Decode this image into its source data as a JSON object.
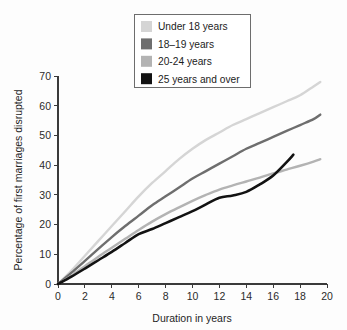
{
  "chart_data": {
    "type": "line",
    "title": "",
    "xlabel": "Duration in years",
    "ylabel": "Percentage of first marriages disrupted",
    "xlim": [
      0,
      20
    ],
    "ylim": [
      0,
      70
    ],
    "xticks": [
      0,
      2,
      4,
      6,
      8,
      10,
      12,
      14,
      16,
      18,
      20
    ],
    "yticks": [
      0,
      10,
      20,
      30,
      40,
      50,
      60,
      70
    ],
    "grid": false,
    "legend_position": "top-center",
    "series": [
      {
        "name": "Under 18 years",
        "color": "#d5d5d5",
        "x": [
          0,
          1,
          2,
          3,
          4,
          5,
          6,
          7,
          8,
          9,
          10,
          11,
          12,
          13,
          14,
          15,
          16,
          17,
          18,
          19,
          19.5
        ],
        "values": [
          0,
          4.5,
          9.5,
          14.5,
          19.5,
          24.5,
          29.5,
          34.0,
          38.0,
          42.0,
          45.5,
          48.5,
          51.0,
          53.5,
          55.5,
          57.5,
          59.5,
          61.5,
          63.5,
          66.5,
          68.0
        ]
      },
      {
        "name": "18–19 years",
        "color": "#6e6e6e",
        "x": [
          0,
          1,
          2,
          3,
          4,
          5,
          6,
          7,
          8,
          9,
          10,
          11,
          12,
          13,
          14,
          15,
          16,
          17,
          18,
          19,
          19.5
        ],
        "values": [
          0,
          3.8,
          7.8,
          11.8,
          15.8,
          19.5,
          23.0,
          26.5,
          29.5,
          32.5,
          35.5,
          38.0,
          40.5,
          43.0,
          45.5,
          47.5,
          49.5,
          51.5,
          53.5,
          55.5,
          57.0
        ]
      },
      {
        "name": "20-24 years",
        "color": "#b3b3b3",
        "x": [
          0,
          1,
          2,
          3,
          4,
          5,
          6,
          7,
          8,
          9,
          10,
          11,
          12,
          13,
          14,
          15,
          16,
          17,
          18,
          19,
          19.5
        ],
        "values": [
          0,
          2.8,
          6.0,
          9.2,
          12.2,
          15.2,
          18.2,
          21.0,
          23.5,
          25.8,
          28.0,
          30.0,
          31.8,
          33.2,
          34.5,
          35.8,
          37.2,
          38.5,
          39.8,
          41.2,
          42.0
        ]
      },
      {
        "name": "25 years and over",
        "color": "#121212",
        "x": [
          0,
          1,
          2,
          3,
          4,
          5,
          6,
          7,
          8,
          9,
          10,
          11,
          12,
          13,
          14,
          15,
          16,
          17,
          17.5
        ],
        "values": [
          0,
          2.5,
          5.2,
          8.0,
          10.8,
          13.8,
          16.8,
          18.5,
          20.5,
          22.5,
          24.5,
          26.8,
          29.0,
          29.8,
          31.0,
          33.5,
          36.5,
          41.0,
          43.5
        ]
      }
    ]
  },
  "legend": {
    "entries": [
      {
        "label": "Under 18 years",
        "color": "#d5d5d5"
      },
      {
        "label": "18–19 years",
        "color": "#6e6e6e"
      },
      {
        "label": "20-24 years",
        "color": "#b3b3b3"
      },
      {
        "label": "25 years and over",
        "color": "#121212"
      }
    ]
  },
  "axes": {
    "x_title": "Duration in years",
    "y_title": "Percentage of first marriages disrupted",
    "x_tick_labels": [
      "0",
      "2",
      "4",
      "6",
      "8",
      "10",
      "12",
      "14",
      "16",
      "18",
      "20"
    ],
    "y_tick_labels": [
      "0",
      "10",
      "20",
      "30",
      "40",
      "50",
      "60",
      "70"
    ]
  }
}
